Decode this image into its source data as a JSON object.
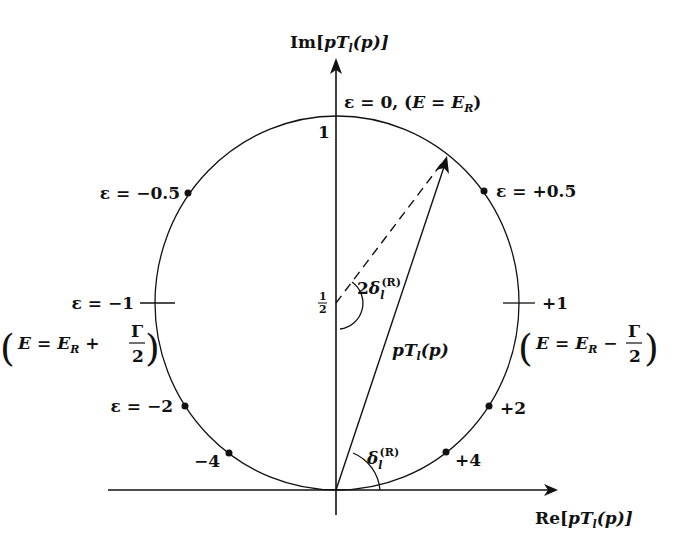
{
  "axes": {
    "y_label": "Im[pT_l(p)]",
    "y_label_parts": {
      "pre": "Im[",
      "p": "p",
      "T": "T",
      "l": "l",
      "post": "(p)]"
    },
    "x_label": "Re[pT_l(p)]",
    "x_label_parts": {
      "pre": "Re[",
      "p": "p",
      "T": "T",
      "l": "l",
      "post": "(p)]"
    },
    "tick_top": "1",
    "tick_half": "1/2",
    "tick_half_num": "1",
    "tick_half_den": "2"
  },
  "circle": {
    "center_label": "(0, 1/2)",
    "radius": "1/2"
  },
  "vectors": {
    "amplitude_label": "pT_l(p)",
    "amplitude_parts": {
      "p": "p",
      "T": "T",
      "l": "l",
      "post": "(p)"
    },
    "phase_label": "δ_l^(R)",
    "double_phase_label": "2δ_l^(R)",
    "delta": "δ",
    "two": "2",
    "sub_l": "l",
    "sup_R": "(R)"
  },
  "points": [
    {
      "epsilon": "0",
      "label": "ε = 0, (E = E_R)",
      "text_pre": "ε = 0, (",
      "E": "E",
      "eq": " = ",
      "ER": "E",
      "ER_sub": "R",
      "text_post": ")"
    },
    {
      "epsilon": "+0.5",
      "label": "ε = +0.5"
    },
    {
      "epsilon": "-0.5",
      "label": "ε = −0.5"
    },
    {
      "epsilon": "-1",
      "label": "ε = −1",
      "condition": "E = E_R + Γ/2",
      "op": "+"
    },
    {
      "epsilon": "+1",
      "label": "+1",
      "condition": "E = E_R − Γ/2",
      "op": "−"
    },
    {
      "epsilon": "-2",
      "label": "ε = −2"
    },
    {
      "epsilon": "+2",
      "label": "+2"
    },
    {
      "epsilon": "-4",
      "label": "−4"
    },
    {
      "epsilon": "+4",
      "label": "+4"
    }
  ],
  "condition_parts": {
    "E": "E",
    "eq": "=",
    "ER": "E",
    "R": "R",
    "gamma": "Γ",
    "two": "2"
  },
  "colors": {
    "ink": "#111111",
    "background": "#ffffff"
  }
}
